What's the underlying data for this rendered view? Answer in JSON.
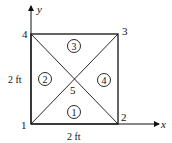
{
  "axes": {
    "x_label": "x",
    "y_label": "y"
  },
  "nodes": [
    {
      "id": "1",
      "label": "1"
    },
    {
      "id": "2",
      "label": "2"
    },
    {
      "id": "3",
      "label": "3"
    },
    {
      "id": "4",
      "label": "4"
    },
    {
      "id": "5",
      "label": "5"
    }
  ],
  "elements": [
    {
      "id": "1",
      "label": "1"
    },
    {
      "id": "2",
      "label": "2"
    },
    {
      "id": "3",
      "label": "3"
    },
    {
      "id": "4",
      "label": "4"
    }
  ],
  "dimensions": {
    "width": "2 ft",
    "height": "2 ft"
  }
}
